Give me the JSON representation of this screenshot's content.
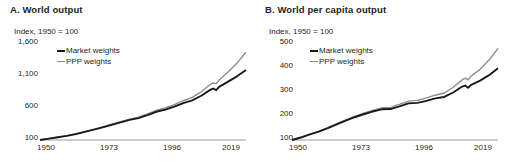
{
  "figure": {
    "background": "#ffffff",
    "colors": {
      "market": "#1a1a1a",
      "ppp": "#8c8c8c",
      "axis": "#9a9a9a",
      "text": "#231f20"
    }
  },
  "panels": [
    {
      "id": "A",
      "title": "A. World output",
      "axis_note": "Index, 1950 = 100",
      "legend": [
        {
          "label": "Market weights",
          "key": "market"
        },
        {
          "label": "PPP weights",
          "key": "ppp"
        }
      ],
      "yticks": [
        "1,600",
        "1,100",
        "600",
        "100"
      ],
      "xticks": [
        "1950",
        "1973",
        "1996",
        "2019"
      ]
    },
    {
      "id": "B",
      "title": "B. World per capita output",
      "axis_note": "Index, 1950 = 100",
      "legend": [
        {
          "label": "Market weights",
          "key": "market"
        },
        {
          "label": "PPP weights",
          "key": "ppp"
        }
      ],
      "yticks": [
        "500",
        "400",
        "300",
        "200",
        "100"
      ],
      "xticks": [
        "1950",
        "1973",
        "1996",
        "2019"
      ]
    }
  ],
  "chart_data": [
    {
      "type": "line",
      "title": "A. World output",
      "subtitle": "Index, 1950 = 100",
      "xlabel": "",
      "ylabel": "Index, 1950 = 100",
      "xlim": [
        1950,
        2019
      ],
      "ylim": [
        100,
        1600
      ],
      "yticks": [
        100,
        600,
        1100,
        1600
      ],
      "xticks": [
        1950,
        1973,
        1996,
        2019
      ],
      "grid": false,
      "legend_position": "upper-left-inside",
      "x": [
        1950,
        1953,
        1956,
        1959,
        1962,
        1965,
        1968,
        1971,
        1974,
        1977,
        1980,
        1983,
        1986,
        1989,
        1992,
        1995,
        1998,
        2001,
        2004,
        2007,
        2008,
        2009,
        2010,
        2013,
        2016,
        2019
      ],
      "series": [
        {
          "name": "Market weights",
          "color": "#1a1a1a",
          "values": [
            100,
            120,
            142,
            163,
            190,
            222,
            256,
            292,
            330,
            368,
            405,
            432,
            477,
            528,
            560,
            605,
            660,
            700,
            770,
            860,
            880,
            855,
            905,
            985,
            1065,
            1160
          ]
        },
        {
          "name": "PPP weights",
          "color": "#8c8c8c",
          "values": [
            100,
            121,
            144,
            166,
            194,
            227,
            262,
            299,
            338,
            378,
            417,
            447,
            495,
            550,
            585,
            635,
            695,
            745,
            830,
            940,
            965,
            950,
            1010,
            1130,
            1265,
            1430
          ]
        }
      ]
    },
    {
      "type": "line",
      "title": "B. World per capita output",
      "subtitle": "Index, 1950 = 100",
      "xlabel": "",
      "ylabel": "Index, 1950 = 100",
      "xlim": [
        1950,
        2019
      ],
      "ylim": [
        100,
        500
      ],
      "yticks": [
        100,
        200,
        300,
        400,
        500
      ],
      "xticks": [
        1950,
        1973,
        1996,
        2019
      ],
      "grid": false,
      "legend_position": "upper-left-inside",
      "x": [
        1950,
        1953,
        1956,
        1959,
        1962,
        1965,
        1968,
        1971,
        1974,
        1977,
        1980,
        1983,
        1986,
        1989,
        1992,
        1995,
        1998,
        2001,
        2004,
        2007,
        2008,
        2009,
        2010,
        2013,
        2016,
        2019
      ],
      "series": [
        {
          "name": "Market weights",
          "color": "#1a1a1a",
          "values": [
            100,
            110,
            123,
            134,
            148,
            163,
            178,
            192,
            204,
            215,
            224,
            225,
            236,
            248,
            250,
            258,
            268,
            274,
            292,
            316,
            320,
            311,
            323,
            340,
            362,
            390
          ]
        },
        {
          "name": "PPP weights",
          "color": "#8c8c8c",
          "values": [
            100,
            111,
            124,
            136,
            150,
            166,
            181,
            195,
            208,
            220,
            230,
            232,
            244,
            257,
            260,
            270,
            281,
            290,
            313,
            343,
            350,
            343,
            358,
            386,
            423,
            470
          ]
        }
      ]
    }
  ]
}
